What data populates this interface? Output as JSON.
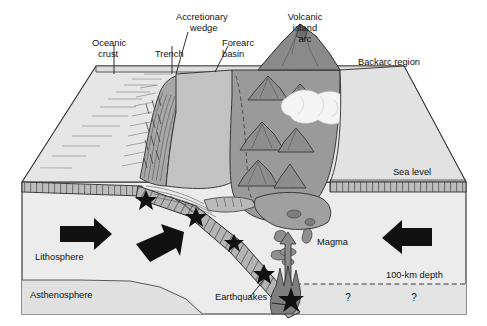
{
  "figure": {
    "width": 487,
    "height": 326
  },
  "labels": {
    "oceanic_crust_line1": "Oceanic",
    "oceanic_crust_line2": "crust",
    "trench": "Trench",
    "accretionary_wedge_line1": "Accretionary",
    "accretionary_wedge_line2": "wedge",
    "forearc_basin_line1": "Forearc",
    "forearc_basin_line2": "basin",
    "volcanic_arc_line1": "Volcanic",
    "volcanic_arc_line2": "island",
    "volcanic_arc_line3": "arc",
    "backarc_region": "Backarc region",
    "sea_level": "Sea level",
    "lithosphere": "Lithosphere",
    "asthenosphere": "Asthenosphere",
    "earthquakes": "Earthquakes",
    "magma": "Magma",
    "depth_100km": "100-km depth",
    "question_mark_left": "?",
    "question_mark_right": "?"
  },
  "colors": {
    "background": "#ffffff",
    "block_face_light": "#ececec",
    "sea_surface": "#dcdcdc",
    "forearc_fill": "#c2c2c2",
    "wedge_fill": "#a8a8a8",
    "arc_fill": "#9a9a9a",
    "arc_dark": "#8a8a8a",
    "slab_fill": "#b5b5b5",
    "asthenosphere_fill": "#e0e0e0",
    "sub_100km_fill": "#e3e3e3",
    "arrow_black": "#111111",
    "star_black": "#111111",
    "outline": "#2b2b2b",
    "steam_white": "#f4f4f4"
  },
  "features": {
    "earthquake_star_count": 5,
    "earthquake_stars": [
      {
        "x": 146,
        "y": 200,
        "r": 8
      },
      {
        "x": 196,
        "y": 217,
        "r": 8
      },
      {
        "x": 234,
        "y": 242,
        "r": 7
      },
      {
        "x": 264,
        "y": 272,
        "r": 7.5
      },
      {
        "x": 291,
        "y": 297,
        "r": 9
      }
    ],
    "motion_arrows": [
      {
        "name": "lithosphere-right-arrow",
        "direction": "right"
      },
      {
        "name": "subduction-down-arrow",
        "direction": "down-right"
      },
      {
        "name": "backarc-left-arrow",
        "direction": "left"
      },
      {
        "name": "magma-up-arrow",
        "direction": "up"
      }
    ]
  }
}
